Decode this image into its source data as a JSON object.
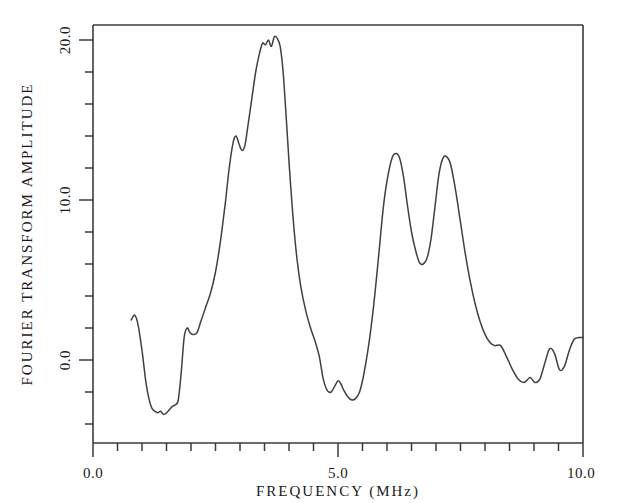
{
  "chart_data": {
    "type": "line",
    "title": "",
    "xlabel": "FREQUENCY (MHz)",
    "ylabel": "FOURIER TRANSFORM AMPLITUDE",
    "xlim": [
      0.0,
      10.0
    ],
    "ylim": [
      -4.3,
      21.2
    ],
    "grid": false,
    "legend": null,
    "x_major_ticks": [
      0.0,
      5.0,
      10.0
    ],
    "x_major_tick_labels": [
      "0.0",
      "5.0",
      "10.0"
    ],
    "x_minor_tick_interval": 0.5,
    "y_major_ticks": [
      0.0,
      10.0,
      20.0
    ],
    "y_major_tick_labels": [
      "0.0",
      "10.0",
      "20.0"
    ],
    "y_minor_tick_interval": 2.0,
    "series": [
      {
        "name": "Fourier transform amplitude",
        "x": [
          0.78,
          0.85,
          0.92,
          1.0,
          1.08,
          1.14,
          1.2,
          1.26,
          1.32,
          1.38,
          1.44,
          1.5,
          1.56,
          1.62,
          1.68,
          1.74,
          1.8,
          1.86,
          1.92,
          1.98,
          2.04,
          2.12,
          2.2,
          2.3,
          2.4,
          2.5,
          2.6,
          2.7,
          2.78,
          2.86,
          2.92,
          2.98,
          3.04,
          3.1,
          3.16,
          3.24,
          3.32,
          3.4,
          3.46,
          3.52,
          3.58,
          3.64,
          3.7,
          3.76,
          3.82,
          3.88,
          3.94,
          4.0,
          4.08,
          4.16,
          4.24,
          4.34,
          4.44,
          4.54,
          4.62,
          4.7,
          4.78,
          4.86,
          4.94,
          5.0,
          5.06,
          5.12,
          5.2,
          5.28,
          5.36,
          5.44,
          5.52,
          5.62,
          5.72,
          5.82,
          5.92,
          6.0,
          6.1,
          6.18,
          6.26,
          6.34,
          6.42,
          6.5,
          6.58,
          6.66,
          6.74,
          6.82,
          6.9,
          6.98,
          7.06,
          7.14,
          7.22,
          7.3,
          7.4,
          7.5,
          7.6,
          7.7,
          7.8,
          7.9,
          8.0,
          8.1,
          8.2,
          8.32,
          8.44,
          8.56,
          8.68,
          8.8,
          8.92,
          9.02,
          9.12,
          9.22,
          9.32,
          9.42,
          9.52,
          9.62,
          9.72,
          9.82,
          9.92,
          10.0
        ],
        "y": [
          2.5,
          2.8,
          2.2,
          0.6,
          -1.4,
          -2.4,
          -3.0,
          -3.2,
          -3.3,
          -3.2,
          -3.4,
          -3.3,
          -3.1,
          -2.9,
          -2.8,
          -2.5,
          -0.8,
          1.4,
          2.0,
          1.7,
          1.6,
          1.7,
          2.4,
          3.3,
          4.2,
          5.5,
          7.4,
          9.8,
          12.0,
          13.6,
          14.0,
          13.5,
          13.1,
          13.4,
          14.6,
          16.3,
          18.0,
          19.2,
          19.8,
          19.7,
          20.0,
          19.6,
          20.2,
          20.1,
          19.6,
          18.0,
          15.3,
          12.4,
          9.0,
          6.4,
          4.6,
          3.1,
          2.0,
          1.1,
          0.2,
          -1.2,
          -1.9,
          -2.0,
          -1.6,
          -1.3,
          -1.5,
          -1.9,
          -2.3,
          -2.5,
          -2.4,
          -2.0,
          -1.0,
          0.8,
          3.2,
          6.2,
          9.4,
          11.2,
          12.6,
          12.9,
          12.6,
          11.4,
          9.6,
          8.0,
          6.9,
          6.1,
          6.0,
          6.4,
          7.6,
          9.6,
          11.6,
          12.6,
          12.7,
          12.2,
          10.6,
          8.6,
          6.6,
          4.9,
          3.5,
          2.4,
          1.6,
          1.1,
          0.9,
          0.9,
          0.2,
          -0.6,
          -1.2,
          -1.4,
          -1.1,
          -1.4,
          -1.2,
          -0.2,
          0.7,
          0.4,
          -0.6,
          -0.4,
          0.6,
          1.3,
          1.4,
          1.4
        ]
      }
    ]
  },
  "axes": {
    "x_axis_label": "FREQUENCY (MHz)",
    "y_axis_label": "FOURIER TRANSFORM AMPLITUDE",
    "x_tick_0": "0.0",
    "x_tick_1": "5.0",
    "x_tick_2": "10.0",
    "y_tick_0": "0.0",
    "y_tick_1": "10.0",
    "y_tick_2": "20.0"
  },
  "colors": {
    "curve": "#404040",
    "frame": "#3a3a3a",
    "text": "#1a1a1a",
    "background": "#ffffff"
  }
}
